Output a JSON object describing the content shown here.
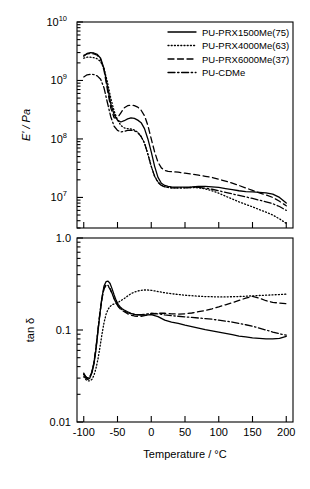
{
  "chart_data": {
    "type": "line",
    "title": "",
    "xlabel": "Temperature / °C",
    "xlim": [
      -110,
      210
    ],
    "xticks": [
      -100,
      -50,
      0,
      50,
      100,
      150,
      200
    ],
    "xticklabels": [
      "-100",
      "-50",
      "0",
      "50",
      "100",
      "150",
      "200"
    ],
    "panels": [
      {
        "name": "storage-modulus",
        "ylabel": "E' / Pa",
        "yscale": "log",
        "ylim": [
          3000000,
          10000000000
        ],
        "yticks": [
          10000000,
          100000000,
          1000000000,
          10000000000
        ],
        "yticklabels": [
          "10^7",
          "10^8",
          "10^9",
          "10^10"
        ],
        "ytickmantissa": [
          "10",
          "10",
          "10",
          "10"
        ],
        "ytickexponent": [
          "7",
          "8",
          "9",
          "10"
        ],
        "grid": false,
        "series": [
          {
            "name": "PU-PRX1500Me(75)",
            "style": "solid",
            "x": [
              -100,
              -95,
              -90,
              -85,
              -80,
              -75,
              -70,
              -65,
              -60,
              -55,
              -50,
              -45,
              -40,
              -35,
              -30,
              -25,
              -20,
              -15,
              -10,
              -5,
              0,
              5,
              10,
              15,
              20,
              25,
              30,
              40,
              50,
              60,
              70,
              80,
              90,
              100,
              110,
              120,
              130,
              140,
              150,
              160,
              170,
              180,
              190,
              200
            ],
            "y": [
              2600000000.0,
              2900000000.0,
              3000000000.0,
              2950000000.0,
              2800000000.0,
              2400000000.0,
              1600000000.0,
              800000000.0,
              400000000.0,
              260000000.0,
              210000000.0,
              195000000.0,
              205000000.0,
              220000000.0,
              230000000.0,
              225000000.0,
              210000000.0,
              190000000.0,
              150000000.0,
              100000000.0,
              60000000.0,
              34000000.0,
              22000000.0,
              17500000.0,
              16000000.0,
              15500000.0,
              15200000.0,
              15000000.0,
              15000000.0,
              15200000.0,
              15500000.0,
              15500000.0,
              15200000.0,
              14800000.0,
              14200000.0,
              13600000.0,
              13000000.0,
              12600000.0,
              12400000.0,
              12200000.0,
              12000000.0,
              11400000.0,
              10000000.0,
              8000000.0
            ]
          },
          {
            "name": "PU-PRX4000Me(63)",
            "style": "dotted",
            "x": [
              -100,
              -95,
              -90,
              -85,
              -80,
              -75,
              -70,
              -65,
              -60,
              -55,
              -50,
              -45,
              -40,
              -35,
              -30,
              -25,
              -20,
              -15,
              -10,
              -5,
              0,
              5,
              10,
              15,
              20,
              25,
              30,
              40,
              50,
              60,
              70,
              80,
              90,
              100,
              110,
              120,
              130,
              140,
              150,
              160,
              170,
              180,
              190,
              200
            ],
            "y": [
              2400000000.0,
              2500000000.0,
              2500000000.0,
              2450000000.0,
              2350000000.0,
              2100000000.0,
              1600000000.0,
              950000000.0,
              500000000.0,
              300000000.0,
              210000000.0,
              170000000.0,
              155000000.0,
              150000000.0,
              148000000.0,
              142000000.0,
              130000000.0,
              110000000.0,
              85000000.0,
              55000000.0,
              34000000.0,
              23000000.0,
              18500000.0,
              16200000.0,
              15200000.0,
              14800000.0,
              14600000.0,
              14500000.0,
              14600000.0,
              14800000.0,
              14600000.0,
              14000000.0,
              13000000.0,
              11800000.0,
              10500000.0,
              9400000.0,
              8400000.0,
              7600000.0,
              6900000.0,
              6200000.0,
              5600000.0,
              5000000.0,
              4300000.0,
              3600000.0
            ]
          },
          {
            "name": "PU-PRX6000Me(37)",
            "style": "dashed",
            "x": [
              -100,
              -95,
              -90,
              -85,
              -80,
              -75,
              -70,
              -65,
              -60,
              -55,
              -50,
              -45,
              -40,
              -35,
              -30,
              -25,
              -20,
              -15,
              -10,
              -5,
              0,
              5,
              10,
              15,
              20,
              25,
              30,
              40,
              50,
              60,
              70,
              80,
              90,
              100,
              110,
              120,
              130,
              140,
              150,
              160,
              170,
              180,
              190,
              200
            ],
            "y": [
              2700000000.0,
              2850000000.0,
              2900000000.0,
              2850000000.0,
              2700000000.0,
              2300000000.0,
              1500000000.0,
              700000000.0,
              340000000.0,
              230000000.0,
              230000000.0,
              280000000.0,
              340000000.0,
              370000000.0,
              380000000.0,
              370000000.0,
              350000000.0,
              310000000.0,
              250000000.0,
              170000000.0,
              100000000.0,
              60000000.0,
              40000000.0,
              32000000.0,
              29000000.0,
              28000000.0,
              27500000.0,
              27000000.0,
              26000000.0,
              25000000.0,
              24000000.0,
              23000000.0,
              22000000.0,
              20500000.0,
              19000000.0,
              17500000.0,
              16000000.0,
              14500000.0,
              13200000.0,
              12000000.0,
              11000000.0,
              10000000.0,
              8600000.0,
              7200000.0
            ]
          },
          {
            "name": "PU-CDMe",
            "style": "dashdot",
            "x": [
              -100,
              -95,
              -90,
              -85,
              -80,
              -75,
              -70,
              -65,
              -60,
              -55,
              -50,
              -45,
              -40,
              -35,
              -30,
              -25,
              -20,
              -15,
              -10,
              -5,
              0,
              5,
              10,
              15,
              20,
              25,
              30,
              40,
              50,
              60,
              70,
              80,
              90,
              100,
              110,
              120,
              130,
              140,
              150,
              160,
              170,
              180,
              190,
              200
            ],
            "y": [
              1150000000.0,
              1250000000.0,
              1280000000.0,
              1260000000.0,
              1200000000.0,
              1050000000.0,
              750000000.0,
              420000000.0,
              240000000.0,
              165000000.0,
              140000000.0,
              132000000.0,
              135000000.0,
              140000000.0,
              142000000.0,
              138000000.0,
              128000000.0,
              110000000.0,
              85000000.0,
              55000000.0,
              34000000.0,
              23000000.0,
              18000000.0,
              16000000.0,
              15200000.0,
              14800000.0,
              14600000.0,
              14500000.0,
              14600000.0,
              14800000.0,
              14800000.0,
              14400000.0,
              13800000.0,
              13000000.0,
              12200000.0,
              11500000.0,
              10800000.0,
              10200000.0,
              9600000.0,
              9000000.0,
              8400000.0,
              7800000.0,
              7000000.0,
              6000000.0
            ]
          }
        ]
      },
      {
        "name": "tan-delta",
        "ylabel": "tan δ",
        "yscale": "log",
        "ylim": [
          0.01,
          1.0
        ],
        "yticks": [
          0.01,
          0.1,
          1.0
        ],
        "yticklabels": [
          "0.01",
          "0.1",
          "1.0"
        ],
        "grid": false,
        "series": [
          {
            "name": "PU-PRX1500Me(75)",
            "style": "solid",
            "x": [
              -100,
              -97,
              -94,
              -91,
              -88,
              -85,
              -82,
              -79,
              -76,
              -73,
              -70,
              -67,
              -64,
              -61,
              -58,
              -55,
              -52,
              -49,
              -46,
              -43,
              -40,
              -35,
              -30,
              -25,
              -20,
              -15,
              -10,
              -5,
              0,
              10,
              20,
              30,
              40,
              50,
              60,
              70,
              80,
              90,
              100,
              110,
              120,
              130,
              140,
              150,
              160,
              170,
              180,
              190,
              200
            ],
            "y": [
              0.033,
              0.03,
              0.029,
              0.03,
              0.034,
              0.042,
              0.06,
              0.095,
              0.15,
              0.225,
              0.3,
              0.335,
              0.34,
              0.32,
              0.28,
              0.24,
              0.21,
              0.19,
              0.178,
              0.17,
              0.165,
              0.158,
              0.152,
              0.148,
              0.146,
              0.145,
              0.145,
              0.146,
              0.147,
              0.14,
              0.128,
              0.122,
              0.118,
              0.113,
              0.109,
              0.105,
              0.101,
              0.098,
              0.095,
              0.092,
              0.089,
              0.086,
              0.084,
              0.082,
              0.081,
              0.08,
              0.08,
              0.081,
              0.085
            ]
          },
          {
            "name": "PU-PRX4000Me(63)",
            "style": "dotted",
            "x": [
              -100,
              -97,
              -94,
              -91,
              -88,
              -85,
              -82,
              -79,
              -76,
              -73,
              -70,
              -67,
              -64,
              -61,
              -58,
              -55,
              -52,
              -49,
              -46,
              -43,
              -40,
              -35,
              -30,
              -25,
              -20,
              -15,
              -10,
              -5,
              0,
              10,
              20,
              30,
              40,
              50,
              60,
              70,
              80,
              90,
              100,
              110,
              120,
              130,
              140,
              150,
              160,
              170,
              180,
              190,
              200
            ],
            "y": [
              0.031,
              0.029,
              0.028,
              0.028,
              0.029,
              0.032,
              0.038,
              0.048,
              0.065,
              0.09,
              0.12,
              0.148,
              0.168,
              0.18,
              0.188,
              0.192,
              0.196,
              0.2,
              0.206,
              0.213,
              0.22,
              0.234,
              0.248,
              0.258,
              0.265,
              0.27,
              0.272,
              0.272,
              0.27,
              0.262,
              0.254,
              0.248,
              0.243,
              0.239,
              0.236,
              0.233,
              0.231,
              0.23,
              0.229,
              0.229,
              0.23,
              0.231,
              0.233,
              0.235,
              0.237,
              0.239,
              0.241,
              0.243,
              0.245
            ]
          },
          {
            "name": "PU-PRX6000Me(37)",
            "style": "dashed",
            "x": [
              -100,
              -97,
              -94,
              -91,
              -88,
              -85,
              -82,
              -79,
              -76,
              -73,
              -70,
              -67,
              -64,
              -61,
              -58,
              -55,
              -52,
              -49,
              -46,
              -43,
              -40,
              -35,
              -30,
              -25,
              -20,
              -15,
              -10,
              -5,
              0,
              10,
              20,
              30,
              40,
              50,
              60,
              70,
              80,
              90,
              100,
              110,
              120,
              130,
              140,
              150,
              160,
              170,
              180,
              190,
              200
            ],
            "y": [
              0.033,
              0.031,
              0.03,
              0.031,
              0.035,
              0.044,
              0.062,
              0.098,
              0.152,
              0.22,
              0.28,
              0.305,
              0.3,
              0.278,
              0.248,
              0.218,
              0.196,
              0.18,
              0.17,
              0.163,
              0.158,
              0.15,
              0.145,
              0.142,
              0.141,
              0.141,
              0.143,
              0.146,
              0.149,
              0.152,
              0.152,
              0.15,
              0.149,
              0.15,
              0.153,
              0.158,
              0.163,
              0.17,
              0.178,
              0.188,
              0.198,
              0.21,
              0.222,
              0.232,
              0.222,
              0.208,
              0.2,
              0.196,
              0.193
            ]
          },
          {
            "name": "PU-CDMe",
            "style": "dashdot",
            "x": [
              -100,
              -97,
              -94,
              -91,
              -88,
              -85,
              -82,
              -79,
              -76,
              -73,
              -70,
              -67,
              -64,
              -61,
              -58,
              -55,
              -52,
              -49,
              -46,
              -43,
              -40,
              -35,
              -30,
              -25,
              -20,
              -15,
              -10,
              -5,
              0,
              10,
              20,
              30,
              40,
              50,
              60,
              70,
              80,
              90,
              100,
              110,
              120,
              130,
              140,
              150,
              160,
              170,
              180,
              190,
              200
            ],
            "y": [
              0.034,
              0.031,
              0.03,
              0.031,
              0.035,
              0.044,
              0.063,
              0.1,
              0.155,
              0.225,
              0.285,
              0.31,
              0.305,
              0.282,
              0.25,
              0.22,
              0.198,
              0.183,
              0.173,
              0.166,
              0.161,
              0.154,
              0.15,
              0.148,
              0.147,
              0.147,
              0.148,
              0.15,
              0.152,
              0.15,
              0.146,
              0.143,
              0.141,
              0.139,
              0.137,
              0.135,
              0.133,
              0.131,
              0.128,
              0.125,
              0.122,
              0.118,
              0.114,
              0.11,
              0.105,
              0.1,
              0.095,
              0.091,
              0.088
            ]
          }
        ]
      }
    ],
    "legend": {
      "position": "upper-right",
      "entries": [
        {
          "label": "PU-PRX1500Me(75)",
          "style": "solid"
        },
        {
          "label": "PU-PRX4000Me(63)",
          "style": "dotted"
        },
        {
          "label": "PU-PRX6000Me(37)",
          "style": "dashed"
        },
        {
          "label": "PU-CDMe",
          "style": "dashdot"
        }
      ]
    }
  }
}
